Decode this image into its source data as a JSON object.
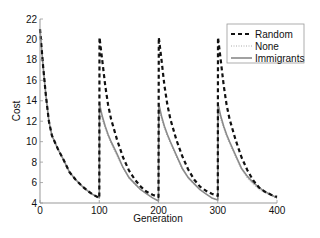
{
  "chart_data": {
    "type": "line",
    "title": "",
    "xlabel": "Generation",
    "ylabel": "Cost",
    "xlim": [
      0,
      400
    ],
    "ylim": [
      4,
      22
    ],
    "xticks": [
      0,
      100,
      200,
      300,
      400
    ],
    "yticks": [
      4,
      6,
      8,
      10,
      12,
      14,
      16,
      18,
      20,
      22
    ],
    "grid": false,
    "legend_position": "upper right",
    "x": [
      0,
      5,
      10,
      15,
      20,
      30,
      40,
      50,
      60,
      70,
      80,
      90,
      100,
      100.5,
      105,
      110,
      115,
      120,
      130,
      140,
      150,
      160,
      170,
      180,
      190,
      200,
      200.5,
      205,
      210,
      215,
      220,
      230,
      240,
      250,
      260,
      270,
      280,
      290,
      300,
      300.5,
      305,
      310,
      315,
      320,
      330,
      340,
      350,
      360,
      370,
      380,
      390,
      400
    ],
    "series": [
      {
        "name": "Random",
        "style": "dashed",
        "color": "#111111",
        "values": [
          21.0,
          17.5,
          14.5,
          12.0,
          10.6,
          9.3,
          8.2,
          7.0,
          6.3,
          5.7,
          5.2,
          4.8,
          4.5,
          20.2,
          18.0,
          15.5,
          13.6,
          12.2,
          10.2,
          8.5,
          7.2,
          6.3,
          5.6,
          5.1,
          4.8,
          4.6,
          20.2,
          18.0,
          15.5,
          13.6,
          12.2,
          10.2,
          8.6,
          7.3,
          6.3,
          5.6,
          5.2,
          4.9,
          4.7,
          20.2,
          18.0,
          15.5,
          13.6,
          12.2,
          10.2,
          8.5,
          7.2,
          6.2,
          5.5,
          5.1,
          4.8,
          4.6
        ]
      },
      {
        "name": "None",
        "style": "dotted",
        "color": "#aaaaaa",
        "values": [
          21.0,
          17.5,
          14.5,
          12.0,
          10.6,
          9.3,
          8.2,
          7.0,
          6.3,
          5.7,
          5.2,
          4.8,
          4.5,
          13.5,
          12.2,
          11.3,
          10.5,
          9.8,
          8.6,
          7.4,
          6.4,
          5.8,
          5.3,
          4.9,
          4.5,
          4.2,
          13.5,
          12.2,
          11.3,
          10.5,
          9.8,
          8.5,
          7.3,
          6.4,
          5.8,
          5.3,
          4.9,
          4.5,
          4.3,
          13.5,
          12.2,
          11.3,
          10.5,
          9.8,
          8.5,
          7.3,
          6.4,
          5.8,
          5.3,
          5.0,
          4.7,
          4.4
        ]
      },
      {
        "name": "Immigrants",
        "style": "solid",
        "color": "#8a8a8a",
        "values": [
          21.0,
          17.5,
          14.5,
          12.0,
          10.6,
          9.3,
          8.2,
          7.0,
          6.3,
          5.7,
          5.2,
          4.8,
          4.5,
          13.7,
          12.5,
          11.5,
          10.7,
          10.0,
          8.8,
          7.5,
          6.5,
          5.9,
          5.3,
          4.9,
          4.5,
          4.2,
          13.7,
          12.5,
          11.5,
          10.7,
          10.0,
          8.7,
          7.4,
          6.5,
          5.9,
          5.3,
          4.9,
          4.5,
          4.3,
          13.7,
          12.5,
          11.5,
          10.7,
          10.0,
          8.7,
          7.4,
          6.6,
          6.0,
          5.5,
          5.1,
          4.8,
          4.5
        ]
      }
    ],
    "legend": [
      "Random",
      "None",
      "Immigrants"
    ]
  }
}
